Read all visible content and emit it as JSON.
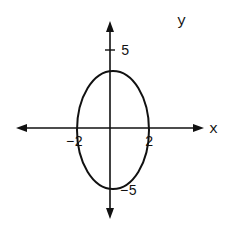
{
  "diagram": {
    "type": "ellipse-graph",
    "axes": {
      "x_label": "x",
      "y_label": "y"
    },
    "ticks": {
      "y_pos": "5",
      "y_neg": "−5",
      "x_pos": "2",
      "x_neg": "−2"
    },
    "ellipse": {
      "center": [
        0,
        0
      ],
      "x_intercepts": [
        -2,
        2
      ],
      "y_intercepts": [
        -5,
        5
      ]
    },
    "stroke_color": "#111111",
    "background": "#ffffff"
  }
}
